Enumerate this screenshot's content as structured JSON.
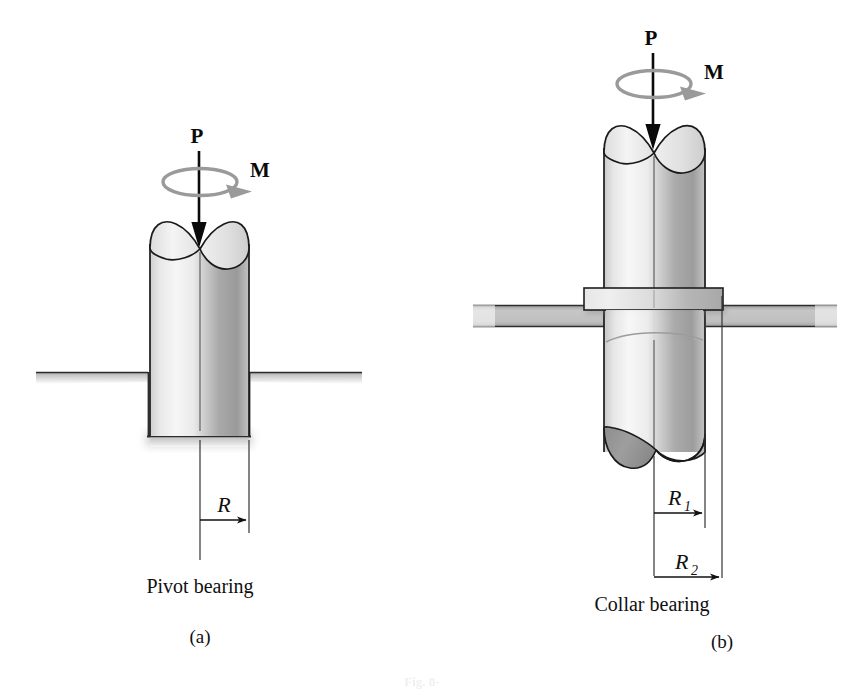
{
  "figure": {
    "background_color": "#ffffff",
    "caption_fragment": "Fig. 8-",
    "subfigures": [
      {
        "id": "a",
        "part_label": "(a)",
        "caption": "Pivot bearing",
        "loads": [
          {
            "name": "axial-force",
            "symbol": "P",
            "type": "force-arrow"
          },
          {
            "name": "torque-moment",
            "symbol": "M",
            "type": "torque-ellipse"
          }
        ],
        "dimensions": [
          {
            "name": "radius",
            "symbol": "R",
            "subscript": ""
          }
        ]
      },
      {
        "id": "b",
        "part_label": "(b)",
        "caption": "Collar bearing",
        "loads": [
          {
            "name": "axial-force",
            "symbol": "P",
            "type": "force-arrow"
          },
          {
            "name": "torque-moment",
            "symbol": "M",
            "type": "torque-ellipse"
          }
        ],
        "dimensions": [
          {
            "name": "inner-radius",
            "symbol": "R",
            "subscript": "1"
          },
          {
            "name": "outer-radius",
            "symbol": "R",
            "subscript": "2"
          }
        ]
      }
    ]
  },
  "colors": {
    "outline": "#1a1a1a",
    "shaft_light": "#f2f2f2",
    "shaft_mid": "#d8d8d8",
    "shaft_dark": "#8f8f8f",
    "ground_gray": "#bcbcbc",
    "plate_gray": "#b4b4b4",
    "collar_gray": "#d2d2d2",
    "torque_gray": "#9a9a9a",
    "arrow_black": "#0a0a0a"
  }
}
